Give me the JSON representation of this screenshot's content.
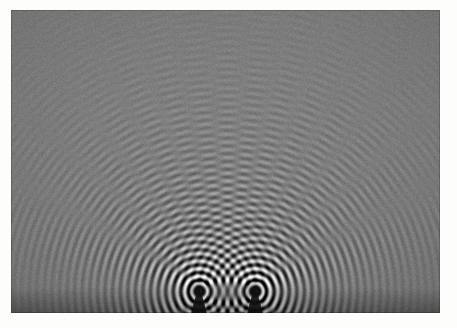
{
  "figure": {
    "title": "Ripple tank two-source interference pattern",
    "medium": "black-and-white photograph",
    "description": "Circular water waves from two in-phase point dippers overlap, producing radial nodal lines and antinodal lines of constructive interference.",
    "border_color": "#fdfdfb",
    "canvas_bg": "#808080"
  },
  "frame": {
    "width": 457,
    "height": 328,
    "border_left": 11,
    "border_top": 10,
    "border_right": 17,
    "border_bottom": 15,
    "content_width": 429,
    "content_height": 303
  },
  "chart_data": {
    "type": "heatmap",
    "title": "Ripple tank two-source interference pattern",
    "xlabel": "",
    "ylabel": "",
    "render": "two-source circular wave superposition",
    "field_width": 429,
    "field_height": 303,
    "wavelength_px": 7.6,
    "phase_deg": 0,
    "source_separation_px": 56,
    "sources": [
      {
        "name": "left-dipper",
        "x": 188,
        "y": 281,
        "amplitude": 1.0,
        "phase_deg": 0
      },
      {
        "name": "right-dipper",
        "x": 244,
        "y": 281,
        "amplitude": 1.0,
        "phase_deg": 0
      }
    ],
    "base_gray": 128,
    "contrast": 120,
    "near_source_falloff": 0.0105,
    "decay_reference_px": 26,
    "grain_strength": 13,
    "vignette_strength": 0.2,
    "global_tilt": 0.04,
    "dipper_shadow": {
      "color": "#141414",
      "stem_half_width": 5,
      "bulb_radius": 7,
      "length": 34
    },
    "axis_ranges": {
      "x": [
        0,
        429
      ],
      "y": [
        0,
        303
      ]
    },
    "grid": false,
    "legend": false,
    "annotations": []
  },
  "a11y": {
    "figure_role": "Photograph of a ripple tank experiment",
    "alt_text": "Two circular wave sources at the bottom center generate overlapping ripples that form a symmetric interference pattern of bright and dark fringes spreading outward."
  }
}
